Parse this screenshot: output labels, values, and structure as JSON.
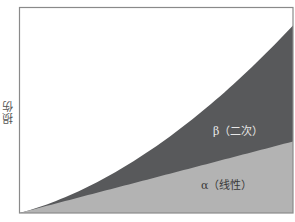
{
  "chart_data": {
    "type": "area",
    "title": "",
    "xlabel": "",
    "ylabel": "损伤",
    "grid": false,
    "legend": "inline labels",
    "x": [
      0,
      0.1,
      0.2,
      0.3,
      0.4,
      0.5,
      0.6,
      0.7,
      0.8,
      0.9,
      1.0
    ],
    "series": [
      {
        "name": "α（线性）",
        "stack": "bottom",
        "color": "#b3b3b3",
        "values": [
          0,
          0.035,
          0.07,
          0.104,
          0.139,
          0.174,
          0.209,
          0.243,
          0.278,
          0.313,
          0.348
        ]
      },
      {
        "name": "β（二次）",
        "stack": "top",
        "color": "#58595b",
        "values": [
          0,
          0.0063,
          0.025,
          0.057,
          0.101,
          0.158,
          0.228,
          0.31,
          0.405,
          0.512,
          0.565
        ]
      }
    ],
    "cumulative_top": [
      0,
      0.041,
      0.095,
      0.161,
      0.24,
      0.332,
      0.437,
      0.553,
      0.683,
      0.825,
      0.913
    ],
    "ylim": [
      0,
      1
    ],
    "xlim": [
      0,
      1
    ]
  },
  "labels": {
    "ylabel": "损伤",
    "beta": "β（二次）",
    "alpha": "α（线性）"
  },
  "colors": {
    "beta": "#58595b",
    "alpha": "#b3b3b3",
    "axis": "#8a8a8a"
  }
}
